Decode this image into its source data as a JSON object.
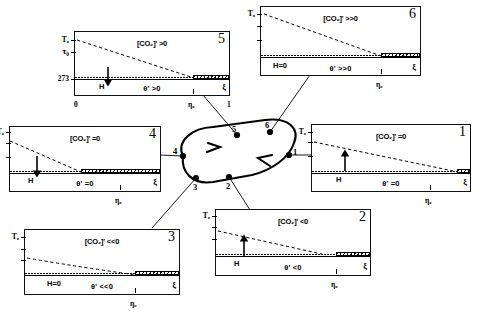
{
  "figure": {
    "type": "diagram"
  },
  "axis": {
    "y_top_label": "T₀",
    "y_tau_label": "τ₀",
    "y_273_label": "273",
    "x_left_label": "0",
    "x_mid_label": "η₀",
    "x_right_label": "1",
    "xi_label": "ξ"
  },
  "panels": [
    {
      "id": "panel-5",
      "number": "5",
      "co2_label": "[CO₂]' >0",
      "theta_label": "θ' >0",
      "h_label": "H",
      "h_arrow": "down",
      "xi_label": "ξ",
      "y_labels": [
        "T₀",
        "τ₀",
        "273"
      ],
      "x_labels": [
        "0",
        "η₀",
        "1"
      ],
      "dash_start_y": 0.12,
      "dash_end_y": 0.72,
      "hatch_start": 0.76
    },
    {
      "id": "panel-6",
      "number": "6",
      "co2_label": "[CO₂]' >>0",
      "theta_label": "θ' >>0",
      "h_label": "H=0",
      "h_arrow": "none",
      "xi_label": "ξ",
      "y_labels": [
        "T₀",
        "",
        ""
      ],
      "x_labels": [
        "",
        "η₀",
        ""
      ],
      "dash_start_y": 0.1,
      "dash_end_y": 0.7,
      "hatch_start": 0.74
    },
    {
      "id": "panel-1",
      "number": "1",
      "co2_label": "[CO₂]' =0",
      "theta_label": "θ' =0",
      "h_label": "H",
      "h_arrow": "up",
      "xi_label": "ξ",
      "y_labels": [
        "T₀",
        "",
        ""
      ],
      "x_labels": [
        "",
        "η₀",
        ""
      ],
      "dash_start_y": 0.26,
      "dash_end_y": 0.7,
      "hatch_start": 0.9
    },
    {
      "id": "panel-4",
      "number": "4",
      "co2_label": "[CO₂]' =0",
      "theta_label": "θ' =0",
      "h_label": "H",
      "h_arrow": "down",
      "xi_label": "ξ",
      "y_labels": [
        "T₀",
        "",
        ""
      ],
      "x_labels": [
        "",
        "η₀",
        ""
      ],
      "dash_start_y": 0.22,
      "dash_end_y": 0.72,
      "hatch_start": 0.47
    },
    {
      "id": "panel-3",
      "number": "3",
      "co2_label": "[CO₂]' <<0",
      "theta_label": "θ' <<0",
      "h_label": "H=0",
      "h_arrow": "none",
      "xi_label": "ξ",
      "y_labels": [
        "T₀",
        "",
        ""
      ],
      "x_labels": [
        "",
        "η₀",
        ""
      ],
      "dash_start_y": 0.46,
      "dash_end_y": 0.7,
      "hatch_start": 0.68
    },
    {
      "id": "panel-2",
      "number": "2",
      "co2_label": "[CO₂]' <0",
      "theta_label": "θ' <0",
      "h_label": "H",
      "h_arrow": "up",
      "xi_label": "ξ",
      "y_labels": [
        "T₀",
        "",
        ""
      ],
      "x_labels": [
        "",
        "η₀",
        ""
      ],
      "dash_start_y": 0.32,
      "dash_end_y": 0.7,
      "hatch_start": 0.78
    }
  ],
  "cycle": {
    "node_labels": [
      "1",
      "2",
      "3",
      "4",
      "5",
      "6"
    ],
    "direction": "counter-clockwise",
    "nodes": [
      {
        "label": "1",
        "x": 289,
        "y": 155
      },
      {
        "label": "2",
        "x": 229,
        "y": 177
      },
      {
        "label": "3",
        "x": 196,
        "y": 178
      },
      {
        "label": "4",
        "x": 183,
        "y": 156
      },
      {
        "label": "5",
        "x": 237,
        "y": 135
      },
      {
        "label": "6",
        "x": 270,
        "y": 132
      }
    ]
  }
}
